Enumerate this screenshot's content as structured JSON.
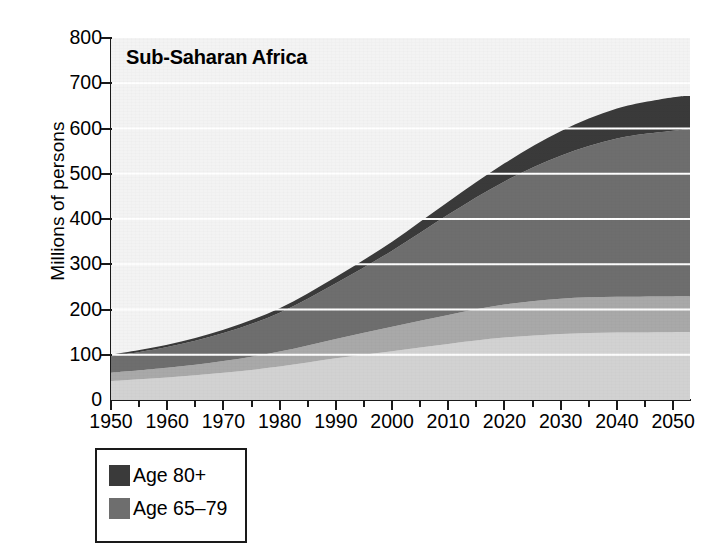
{
  "chart_data": {
    "type": "area",
    "stacked": true,
    "title": "Sub-Saharan Africa",
    "xlabel": "",
    "ylabel": "Millions of persons",
    "ylim": [
      0,
      800
    ],
    "xlim": [
      1950,
      2053
    ],
    "ytick_labels": [
      "800",
      "700",
      "600",
      "500",
      "400",
      "300",
      "200",
      "100",
      "0"
    ],
    "ytick_values": [
      800,
      700,
      600,
      500,
      400,
      300,
      200,
      100,
      0
    ],
    "xtick_labels": [
      "1950",
      "1960",
      "1970",
      "1980",
      "1990",
      "2000",
      "2010",
      "2020",
      "2030",
      "2040",
      "2050"
    ],
    "xtick_values": [
      1950,
      1960,
      1970,
      1980,
      1990,
      2000,
      2010,
      2020,
      2030,
      2040,
      2050
    ],
    "minor_tick_interval": 5,
    "grid": "horizontal-white",
    "legend_position": "below-left",
    "x": [
      1950,
      1960,
      1970,
      1980,
      1990,
      2000,
      2010,
      2020,
      2030,
      2040,
      2050,
      2053
    ],
    "series": [
      {
        "name": "Age 0-14",
        "color": "#d2d2d2",
        "order": 1,
        "values": [
          42,
          50,
          60,
          74,
          92,
          108,
          124,
          138,
          146,
          149,
          150,
          150
        ]
      },
      {
        "name": "Age 15-64",
        "color": "#a9a9a9",
        "order": 2,
        "values": [
          18,
          21,
          26,
          33,
          43,
          54,
          64,
          73,
          78,
          79,
          79,
          79
        ]
      },
      {
        "name": "Age 65-79",
        "color": "#6e6e6e",
        "order": 3,
        "values": [
          36,
          46,
          62,
          86,
          123,
          168,
          222,
          272,
          316,
          350,
          366,
          368
        ]
      },
      {
        "name": "Age 80+",
        "color": "#3a3a3a",
        "order": 4,
        "values": [
          4,
          5,
          7,
          10,
          14,
          20,
          28,
          40,
          54,
          66,
          74,
          75
        ]
      }
    ],
    "totals": [
      100,
      122,
      155,
      203,
      272,
      350,
      438,
      523,
      594,
      644,
      669,
      672
    ],
    "annotations": []
  },
  "axis": {
    "y_title": "Millions of persons"
  },
  "legend": {
    "items": [
      {
        "label": "Age 80+",
        "color": "#3a3a3a",
        "swatch": "legend-swatch-age-80-plus"
      },
      {
        "label": "Age 65–79",
        "color": "#6e6e6e",
        "swatch": "legend-swatch-age-65-79"
      }
    ]
  },
  "colors": {
    "plot_background": "#f3f3f3",
    "gridline": "#ffffff",
    "axis": "#1a1a1a",
    "band_darkest": "#3a3a3a",
    "band_dark": "#6e6e6e",
    "band_mid": "#a9a9a9",
    "band_light": "#d2d2d2"
  }
}
